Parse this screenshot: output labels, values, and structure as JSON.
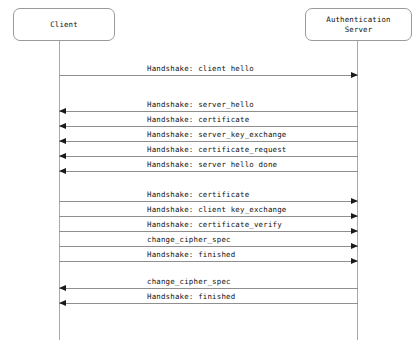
{
  "diagram": {
    "type": "sequence-diagram",
    "colors": {
      "background": "#ffffff",
      "box_border": "#9a9a9a",
      "lifeline": "#a9a9a9",
      "message_line": "#8f8f8f",
      "arrowhead": "#1a1a1a",
      "text": "#111111"
    },
    "participants": [
      {
        "id": "client",
        "label": "Client",
        "lifeline_x": 59
      },
      {
        "id": "server",
        "label": "Authentication\nServer",
        "lifeline_x": 357
      }
    ],
    "messages": [
      {
        "label": "Handshake: client hello",
        "direction": "to-right",
        "from": "client",
        "to": "server",
        "y": 75
      },
      {
        "label": "Handshake: server_hello",
        "direction": "to-left",
        "from": "server",
        "to": "client",
        "y": 111
      },
      {
        "label": "Handshake: certificate",
        "direction": "to-left",
        "from": "server",
        "to": "client",
        "y": 126
      },
      {
        "label": "Handshake: server_key_exchange",
        "direction": "to-left",
        "from": "server",
        "to": "client",
        "y": 141
      },
      {
        "label": "Handshake: certificate_request",
        "direction": "to-left",
        "from": "server",
        "to": "client",
        "y": 156
      },
      {
        "label": "Handshake: server hello done",
        "direction": "to-left",
        "from": "server",
        "to": "client",
        "y": 171
      },
      {
        "label": "Handshake: certificate",
        "direction": "to-right",
        "from": "client",
        "to": "server",
        "y": 201
      },
      {
        "label": "Handshake: client key_exchange",
        "direction": "to-right",
        "from": "client",
        "to": "server",
        "y": 216
      },
      {
        "label": "Handshake: certificate_verify",
        "direction": "to-right",
        "from": "client",
        "to": "server",
        "y": 231
      },
      {
        "label": "change_cipher_spec",
        "direction": "to-right",
        "from": "client",
        "to": "server",
        "y": 246
      },
      {
        "label": "Handshake: finished",
        "direction": "to-right",
        "from": "client",
        "to": "server",
        "y": 261
      },
      {
        "label": "change_cipher_spec",
        "direction": "to-left",
        "from": "server",
        "to": "client",
        "y": 288
      },
      {
        "label": "Handshake: finished",
        "direction": "to-left",
        "from": "server",
        "to": "client",
        "y": 303
      }
    ]
  }
}
